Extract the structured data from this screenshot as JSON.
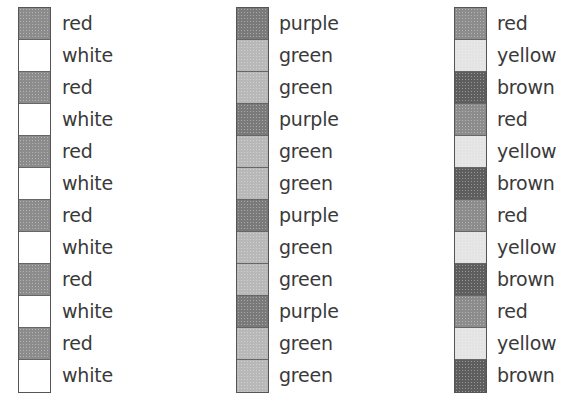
{
  "shade_colors": {
    "red": "#8c8c8c",
    "white": "#ffffff",
    "purple": "#7a7a7a",
    "green": "#b8b8b8",
    "yellow": "#e4e4e4",
    "brown": "#5e5e5e"
  },
  "columns": [
    {
      "name": "column-1",
      "items": [
        "red",
        "white",
        "red",
        "white",
        "red",
        "white",
        "red",
        "white",
        "red",
        "white",
        "red",
        "white"
      ]
    },
    {
      "name": "column-2",
      "items": [
        "purple",
        "green",
        "green",
        "purple",
        "green",
        "green",
        "purple",
        "green",
        "green",
        "purple",
        "green",
        "green"
      ]
    },
    {
      "name": "column-3",
      "items": [
        "red",
        "yellow",
        "brown",
        "red",
        "yellow",
        "brown",
        "red",
        "yellow",
        "brown",
        "red",
        "yellow",
        "brown"
      ]
    }
  ]
}
